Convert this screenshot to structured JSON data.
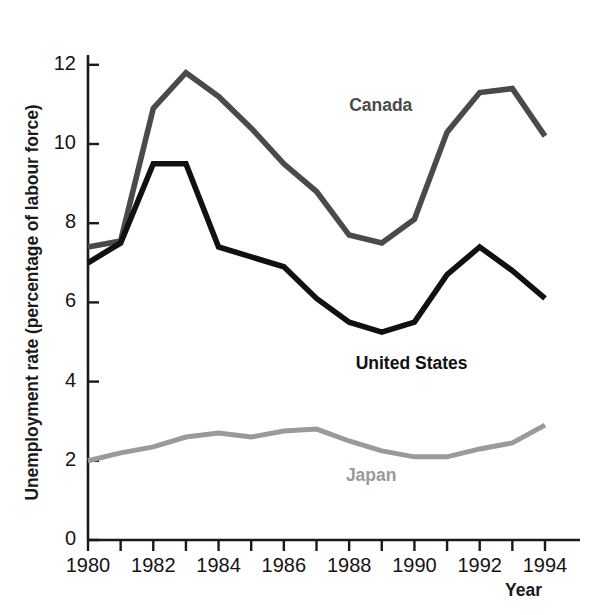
{
  "chart_data": {
    "type": "line",
    "title": "",
    "xlabel": "Year",
    "ylabel": "Unemployment rate (percentage of labour force)",
    "x": [
      1980,
      1981,
      1982,
      1983,
      1984,
      1985,
      1986,
      1987,
      1988,
      1989,
      1990,
      1991,
      1992,
      1993,
      1994
    ],
    "xlim": [
      1980,
      1994
    ],
    "ylim": [
      0,
      12.6
    ],
    "xticks": [
      1980,
      1981,
      1982,
      1983,
      1984,
      1985,
      1986,
      1987,
      1988,
      1989,
      1990,
      1991,
      1992,
      1993,
      1994
    ],
    "xtick_labels": [
      "1980",
      "",
      "1982",
      "",
      "1984",
      "",
      "1986",
      "",
      "1988",
      "",
      "1990",
      "",
      "1992",
      "",
      "1994"
    ],
    "yticks": [
      0,
      2,
      4,
      6,
      8,
      10,
      12
    ],
    "ytick_labels": [
      "0",
      "2",
      "4",
      "6",
      "8",
      "10",
      "12"
    ],
    "grid": false,
    "legend": "inline-annotations",
    "series": [
      {
        "name": "Canada",
        "color": "#4a4a4a",
        "label_x": 1988.0,
        "label_y": 10.95,
        "values": [
          7.4,
          7.55,
          10.9,
          11.8,
          11.2,
          10.4,
          9.5,
          8.8,
          7.7,
          7.5,
          8.1,
          10.3,
          11.3,
          11.4,
          10.2
        ]
      },
      {
        "name": "United States",
        "color": "#111111",
        "label_x": 1988.2,
        "label_y": 4.45,
        "values": [
          7.0,
          7.5,
          9.5,
          9.5,
          7.4,
          7.15,
          6.9,
          6.1,
          5.5,
          5.25,
          5.5,
          6.7,
          7.4,
          6.8,
          6.1
        ]
      },
      {
        "name": "Japan",
        "color": "#9a9a9a",
        "label_x": 1987.9,
        "label_y": 1.62,
        "values": [
          2.0,
          2.2,
          2.35,
          2.6,
          2.7,
          2.6,
          2.75,
          2.8,
          2.5,
          2.25,
          2.1,
          2.1,
          2.3,
          2.45,
          2.9
        ]
      }
    ]
  },
  "axis": {
    "y_axis_caption": "Unemployment rate (percentage of labour force)",
    "x_axis_caption": "Year"
  }
}
